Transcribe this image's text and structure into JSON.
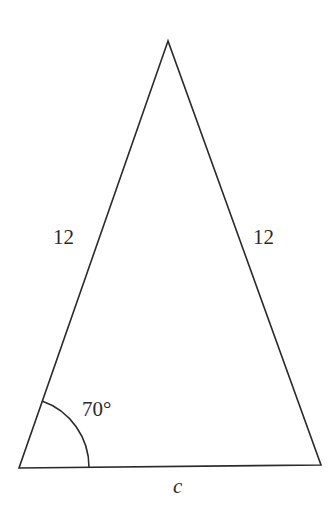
{
  "figure": {
    "type": "isosceles-triangle",
    "line_color": "#2a2a2a",
    "background": "#ffffff",
    "vertices": {
      "apex": [
        168,
        41
      ],
      "bottom_left": [
        19,
        468
      ],
      "bottom_right": [
        321,
        465
      ]
    },
    "labels": {
      "left_side": "12",
      "right_side": "12",
      "base": "c",
      "angle": "70°"
    },
    "angle_marker": {
      "vertex": "bottom_left",
      "degrees": 70
    }
  }
}
